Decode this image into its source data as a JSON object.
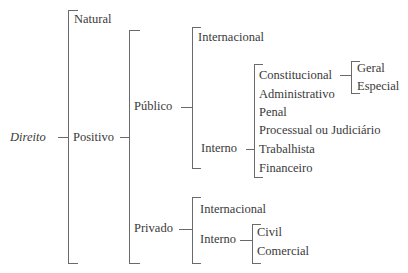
{
  "diagram": {
    "type": "bracket-tree",
    "root": "Direito",
    "nodes": {
      "root": "Direito",
      "natural": "Natural",
      "positivo": "Positivo",
      "publico": "Público",
      "publico_internacional": "Internacional",
      "publico_interno": "Interno",
      "interno_items": [
        "Constitucional",
        "Administrativo",
        "Penal",
        "Processual ou Judiciário",
        "Trabalhista",
        "Financeiro"
      ],
      "constitucional_items": [
        "Geral",
        "Especial"
      ],
      "privado": "Privado",
      "privado_internacional": "Internacional",
      "privado_interno": "Interno",
      "privado_interno_items": [
        "Civil",
        "Comercial"
      ]
    },
    "tree": {
      "Direito": {
        "Natural": {},
        "Positivo": {
          "Público": {
            "Internacional": {},
            "Interno": {
              "Constitucional": {
                "Geral": {},
                "Especial": {}
              },
              "Administrativo": {},
              "Penal": {},
              "Processual ou Judiciário": {},
              "Trabalhista": {},
              "Financeiro": {}
            }
          },
          "Privado": {
            "Internacional": {},
            "Interno": {
              "Civil": {},
              "Comercial": {}
            }
          }
        }
      }
    }
  }
}
